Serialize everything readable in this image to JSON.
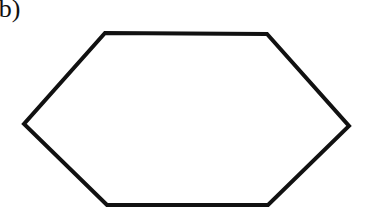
{
  "figure": {
    "label": "(b)",
    "shape": "hexagon",
    "stroke_color": "#111111",
    "fill_color": "#ffffff",
    "vertices": [
      [
        105,
        33
      ],
      [
        267,
        34
      ],
      [
        349,
        126
      ],
      [
        268,
        205
      ],
      [
        107,
        205
      ],
      [
        24,
        124
      ]
    ]
  }
}
